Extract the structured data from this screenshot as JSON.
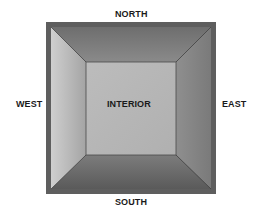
{
  "diagram": {
    "labels": {
      "north": "NORTH",
      "south": "SOUTH",
      "west": "WEST",
      "east": "EAST",
      "interior": "INTERIOR"
    },
    "colors": {
      "outer_frame": "#5e5e5e",
      "north_panel": "#7b7b7b",
      "south_panel": "#6a6a6a",
      "west_panel": "#bdbdbd",
      "east_panel": "#8a8a8a",
      "interior": "#b8b8b8",
      "edge_line": "#3c3c3c"
    }
  }
}
